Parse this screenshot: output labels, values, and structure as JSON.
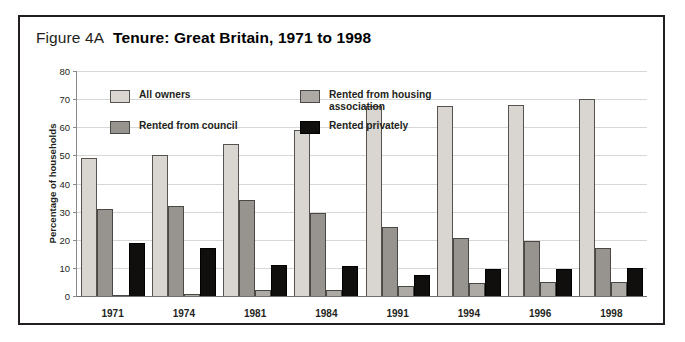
{
  "figure": {
    "number": "Figure 4A",
    "title": "Tenure:  Great Britain, 1971 to 1998"
  },
  "colors": {
    "all_owners": "#d9d6d1",
    "rented_from_council": "#97948f",
    "rented_from_housing_association": "#adaaa5",
    "rented_privately": "#100f0d",
    "frame": "#231f20",
    "gridline": "#d7d7d7"
  },
  "legend": {
    "position": "inside-top-left",
    "items": [
      {
        "label": "All owners",
        "series": 0
      },
      {
        "label": "Rented from housing\nassociation",
        "series": 2
      },
      {
        "label": "Rented from council",
        "series": 1
      },
      {
        "label": "Rented privately",
        "series": 3
      }
    ]
  },
  "chart_data": {
    "type": "bar",
    "title": "Tenure:  Great Britain, 1971 to 1998",
    "xlabel": "",
    "ylabel": "Percentage of households",
    "ylim": [
      0,
      80
    ],
    "yticks": [
      0,
      10,
      20,
      30,
      40,
      50,
      60,
      70,
      80
    ],
    "grid": true,
    "categories": [
      "1971",
      "1974",
      "1981",
      "1984",
      "1991",
      "1994",
      "1996",
      "1998"
    ],
    "series": [
      {
        "name": "All owners",
        "values": [
          49,
          50,
          54,
          59,
          67.5,
          67.5,
          68,
          70
        ]
      },
      {
        "name": "Rented from council",
        "values": [
          31,
          32,
          34,
          29.5,
          24.5,
          20.5,
          19.5,
          17
        ]
      },
      {
        "name": "Rented from housing association",
        "values": [
          0.5,
          0.6,
          2,
          2.2,
          3.5,
          4.5,
          5,
          5
        ]
      },
      {
        "name": "Rented privately",
        "values": [
          19,
          17,
          11,
          10.5,
          7.5,
          9.5,
          9.5,
          10
        ]
      }
    ]
  }
}
